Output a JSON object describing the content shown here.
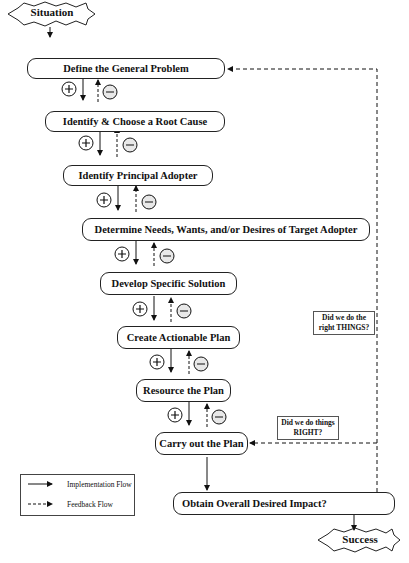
{
  "start": "Situation",
  "end": "Success",
  "steps": [
    "Define the General Problem",
    "Identify & Choose a Root Cause",
    "Identify Principal Adopter",
    "Determine Needs, Wants, and/or Desires of Target Adopter",
    "Develop Specific Solution",
    "Create Actionable Plan",
    "Resource the Plan",
    "Carry out the Plan"
  ],
  "decision": "Obtain Overall Desired Impact?",
  "questions": {
    "things": "Did we do the right THINGS?",
    "right": "Did we do things RIGHT?"
  },
  "legend": {
    "implementation": "Implementation Flow",
    "feedback": "Feedback Flow"
  },
  "symbols": {
    "plus": "+",
    "minus": "−"
  }
}
